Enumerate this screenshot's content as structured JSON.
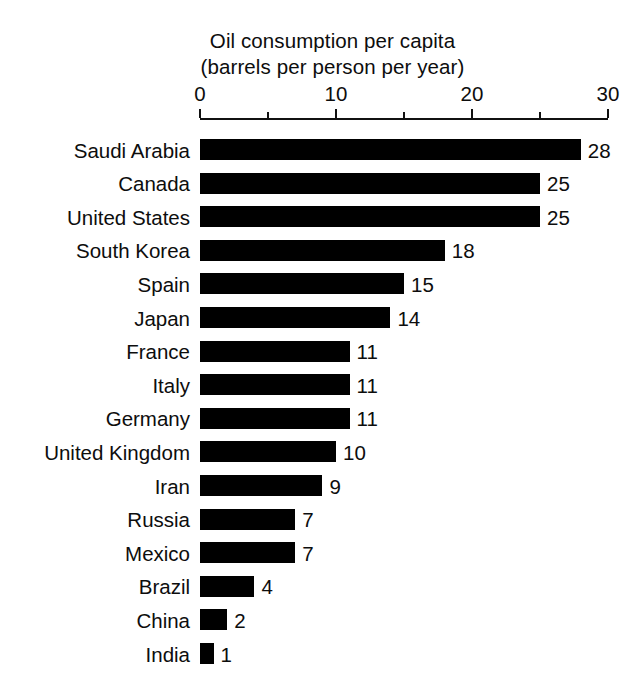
{
  "chart_data": {
    "type": "bar",
    "orientation": "horizontal",
    "title": "Oil consumption per capita",
    "subtitle": "(barrels per person per year)",
    "xlabel": "",
    "ylabel": "",
    "xlim": [
      0,
      30
    ],
    "grid": false,
    "legend": null,
    "bar_color": "#000000",
    "background_color": "#ffffff",
    "text_color": "#0d0d0d",
    "axis_major_ticks": [
      0,
      10,
      20,
      30
    ],
    "axis_minor_ticks": [
      5,
      15,
      25
    ],
    "axis_tick_labels": [
      "0",
      "10",
      "20",
      "30"
    ],
    "categories": [
      "Saudi Arabia",
      "Canada",
      "United States",
      "South Korea",
      "Spain",
      "Japan",
      "France",
      "Italy",
      "Germany",
      "United Kingdom",
      "Iran",
      "Russia",
      "Mexico",
      "Brazil",
      "China",
      "India"
    ],
    "values": [
      28,
      25,
      25,
      18,
      15,
      14,
      11,
      11,
      11,
      10,
      9,
      7,
      7,
      4,
      2,
      1
    ],
    "value_labels": [
      "28",
      "25",
      "25",
      "18",
      "15",
      "14",
      "11",
      "11",
      "11",
      "10",
      "9",
      "7",
      "7",
      "4",
      "2",
      "1"
    ],
    "bars": [
      {
        "label": "Saudi Arabia",
        "value": 28,
        "value_label": "28"
      },
      {
        "label": "Canada",
        "value": 25,
        "value_label": "25"
      },
      {
        "label": "United States",
        "value": 25,
        "value_label": "25"
      },
      {
        "label": "South Korea",
        "value": 18,
        "value_label": "18"
      },
      {
        "label": "Spain",
        "value": 15,
        "value_label": "15"
      },
      {
        "label": "Japan",
        "value": 14,
        "value_label": "14"
      },
      {
        "label": "France",
        "value": 11,
        "value_label": "11"
      },
      {
        "label": "Italy",
        "value": 11,
        "value_label": "11"
      },
      {
        "label": "Germany",
        "value": 11,
        "value_label": "11"
      },
      {
        "label": "United Kingdom",
        "value": 10,
        "value_label": "10"
      },
      {
        "label": "Iran",
        "value": 9,
        "value_label": "9"
      },
      {
        "label": "Russia",
        "value": 7,
        "value_label": "7"
      },
      {
        "label": "Mexico",
        "value": 7,
        "value_label": "7"
      },
      {
        "label": "Brazil",
        "value": 4,
        "value_label": "4"
      },
      {
        "label": "China",
        "value": 2,
        "value_label": "2"
      },
      {
        "label": "India",
        "value": 1,
        "value_label": "1"
      }
    ]
  },
  "layout": {
    "axis_x0_px": 200,
    "axis_x1_px": 608,
    "axis_line_y_px": 118,
    "major_tick_len_px": 9,
    "minor_tick_len_px": 6,
    "first_bar_top_px": 139,
    "bar_height_px": 21,
    "bar_pitch_px": 33.6,
    "value_gap_px": 7
  }
}
